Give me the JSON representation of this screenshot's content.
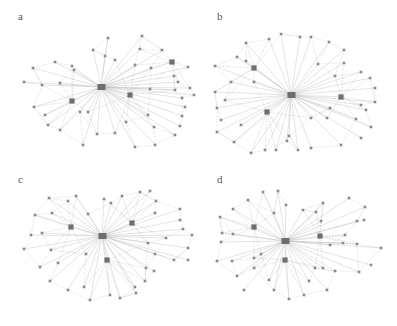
{
  "figure": {
    "colors": {
      "edge": "#b8b8b8",
      "node": "#8a8a8a",
      "hub": "#6e6e6e",
      "label": "#555555"
    },
    "panels": [
      {
        "label": "a",
        "center": [
          101,
          87
        ],
        "hubs": [
          [
            72,
            101
          ],
          [
            130,
            95
          ],
          [
            172,
            62
          ]
        ],
        "nodes": [
          [
            33,
            68
          ],
          [
            55,
            62
          ],
          [
            72,
            66
          ],
          [
            24,
            82
          ],
          [
            42,
            85
          ],
          [
            60,
            83
          ],
          [
            34,
            107
          ],
          [
            45,
            115
          ],
          [
            48,
            125
          ],
          [
            60,
            130
          ],
          [
            80,
            112
          ],
          [
            88,
            112
          ],
          [
            83,
            145
          ],
          [
            74,
            70
          ],
          [
            93,
            50
          ],
          [
            108,
            38
          ],
          [
            142,
            36
          ],
          [
            140,
            49
          ],
          [
            162,
            50
          ],
          [
            135,
            65
          ],
          [
            151,
            68
          ],
          [
            188,
            67
          ],
          [
            174,
            76
          ],
          [
            178,
            82
          ],
          [
            190,
            88
          ],
          [
            194,
            95
          ],
          [
            182,
            98
          ],
          [
            185,
            107
          ],
          [
            182,
            116
          ],
          [
            180,
            126
          ],
          [
            154,
            127
          ],
          [
            175,
            135
          ],
          [
            155,
            145
          ],
          [
            135,
            147
          ],
          [
            126,
            122
          ],
          [
            115,
            133
          ],
          [
            97,
            134
          ],
          [
            148,
            115
          ],
          [
            105,
            56
          ],
          [
            115,
            60
          ],
          [
            150,
            89
          ],
          [
            175,
            90
          ]
        ]
      },
      {
        "label": "b",
        "center": [
          92,
          95
        ],
        "hubs": [
          [
            55,
            68
          ],
          [
            142,
            97
          ],
          [
            68,
            112
          ]
        ],
        "nodes": [
          [
            47,
            43
          ],
          [
            70,
            39
          ],
          [
            82,
            34
          ],
          [
            101,
            37
          ],
          [
            112,
            37
          ],
          [
            130,
            42
          ],
          [
            145,
            50
          ],
          [
            145,
            63
          ],
          [
            119,
            64
          ],
          [
            16,
            66
          ],
          [
            38,
            57
          ],
          [
            47,
            61
          ],
          [
            32,
            82
          ],
          [
            55,
            82
          ],
          [
            16,
            92
          ],
          [
            26,
            100
          ],
          [
            18,
            108
          ],
          [
            22,
            120
          ],
          [
            18,
            132
          ],
          [
            42,
            125
          ],
          [
            35,
            142
          ],
          [
            52,
            153
          ],
          [
            66,
            150
          ],
          [
            88,
            141
          ],
          [
            99,
            150
          ],
          [
            77,
            150
          ],
          [
            90,
            136
          ],
          [
            112,
            148
          ],
          [
            142,
            145
          ],
          [
            162,
            138
          ],
          [
            172,
            127
          ],
          [
            167,
            110
          ],
          [
            176,
            102
          ],
          [
            176,
            88
          ],
          [
            171,
            78
          ],
          [
            162,
            72
          ],
          [
            136,
            76
          ],
          [
            162,
            105
          ],
          [
            131,
            108
          ],
          [
            128,
            118
          ],
          [
            112,
            118
          ],
          [
            157,
            119
          ]
        ]
      },
      {
        "label": "c",
        "center": [
          102,
          73
        ],
        "hubs": [
          [
            71,
            64
          ],
          [
            132,
            60
          ],
          [
            107,
            97
          ]
        ],
        "nodes": [
          [
            49,
            35
          ],
          [
            68,
            38
          ],
          [
            76,
            33
          ],
          [
            35,
            52
          ],
          [
            52,
            50
          ],
          [
            88,
            51
          ],
          [
            31,
            72
          ],
          [
            42,
            70
          ],
          [
            24,
            86
          ],
          [
            40,
            104
          ],
          [
            51,
            87
          ],
          [
            58,
            100
          ],
          [
            86,
            91
          ],
          [
            104,
            36
          ],
          [
            111,
            40
          ],
          [
            122,
            33
          ],
          [
            140,
            29
          ],
          [
            150,
            28
          ],
          [
            156,
            38
          ],
          [
            155,
            50
          ],
          [
            180,
            46
          ],
          [
            180,
            57
          ],
          [
            183,
            66
          ],
          [
            192,
            72
          ],
          [
            188,
            85
          ],
          [
            188,
            97
          ],
          [
            174,
            97
          ],
          [
            166,
            75
          ],
          [
            148,
            80
          ],
          [
            155,
            91
          ],
          [
            146,
            105
          ],
          [
            154,
            108
          ],
          [
            145,
            118
          ],
          [
            135,
            124
          ],
          [
            120,
            135
          ],
          [
            110,
            132
          ],
          [
            90,
            137
          ],
          [
            68,
            127
          ],
          [
            50,
            118
          ],
          [
            84,
            124
          ],
          [
            136,
            130
          ]
        ]
      },
      {
        "label": "d",
        "center": [
          86,
          78
        ],
        "hubs": [
          [
            55,
            64
          ],
          [
            121,
            73
          ],
          [
            86,
            97
          ]
        ],
        "nodes": [
          [
            21,
            54
          ],
          [
            34,
            46
          ],
          [
            49,
            37
          ],
          [
            64,
            29
          ],
          [
            79,
            28
          ],
          [
            87,
            42
          ],
          [
            75,
            50
          ],
          [
            22,
            79
          ],
          [
            23,
            70
          ],
          [
            34,
            71
          ],
          [
            18,
            98
          ],
          [
            33,
            98
          ],
          [
            55,
            95
          ],
          [
            55,
            105
          ],
          [
            38,
            113
          ],
          [
            45,
            127
          ],
          [
            62,
            91
          ],
          [
            70,
            117
          ],
          [
            75,
            127
          ],
          [
            90,
            136
          ],
          [
            105,
            132
          ],
          [
            110,
            118
          ],
          [
            116,
            105
          ],
          [
            124,
            105
          ],
          [
            136,
            108
          ],
          [
            128,
            127
          ],
          [
            160,
            109
          ],
          [
            172,
            102
          ],
          [
            182,
            85
          ],
          [
            158,
            81
          ],
          [
            146,
            72
          ],
          [
            131,
            82
          ],
          [
            117,
            49
          ],
          [
            104,
            47
          ],
          [
            124,
            40
          ],
          [
            150,
            35
          ],
          [
            166,
            44
          ],
          [
            165,
            57
          ],
          [
            158,
            58
          ],
          [
            122,
            58
          ],
          [
            144,
            80
          ]
        ]
      }
    ]
  }
}
